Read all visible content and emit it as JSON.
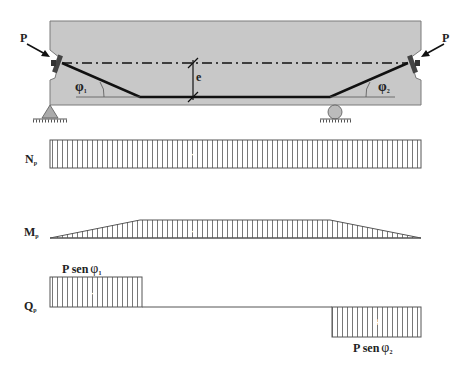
{
  "beam": {
    "force_left": "P",
    "force_right": "P",
    "eccentricity": "e",
    "angle_left": "φ",
    "angle_left_sub": "1",
    "angle_right": "φ",
    "angle_right_sub": "2",
    "colors": {
      "concrete": "#c8c8c8",
      "tendon": "#111111",
      "outline": "#7a7a7a"
    }
  },
  "diagrams": {
    "normal": {
      "label": "N",
      "sub": "p",
      "sign": "-"
    },
    "moment": {
      "label": "M",
      "sub": "p",
      "sign": "-"
    },
    "shear": {
      "label": "Q",
      "sub": "p",
      "left_sign": "-",
      "right_sign": "+",
      "left_value": "P sen",
      "left_phi": "φ",
      "left_sub": "1",
      "right_value": "P sen",
      "right_phi": "φ",
      "right_sub": "2"
    }
  }
}
